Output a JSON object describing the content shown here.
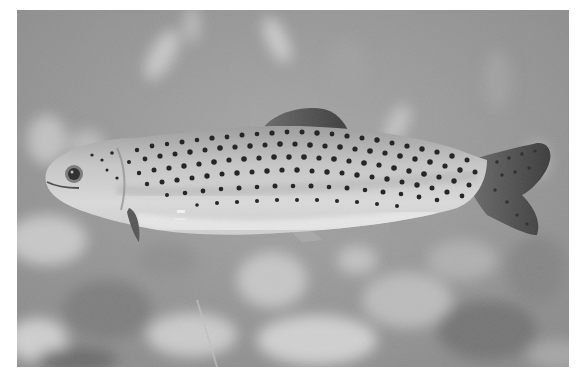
{
  "image": {
    "subject": "rainbow trout swimming underwater",
    "style": "grayscale photograph",
    "frame": {
      "x": 17,
      "y": 10,
      "width": 552,
      "height": 357
    },
    "colors": {
      "page_background": "#ffffff",
      "water_background": "#9a9a9a",
      "fish_body_light": "#d4d4d4",
      "fish_belly": "#e6e6e6",
      "fish_spots": "#1e1e1e",
      "fins": "#5a5a5a"
    },
    "elements": [
      {
        "name": "trout",
        "position": "center",
        "facing": "left"
      },
      {
        "name": "blurred-rocks",
        "position": "bottom"
      },
      {
        "name": "blurred-vegetation",
        "position": "top"
      }
    ]
  }
}
